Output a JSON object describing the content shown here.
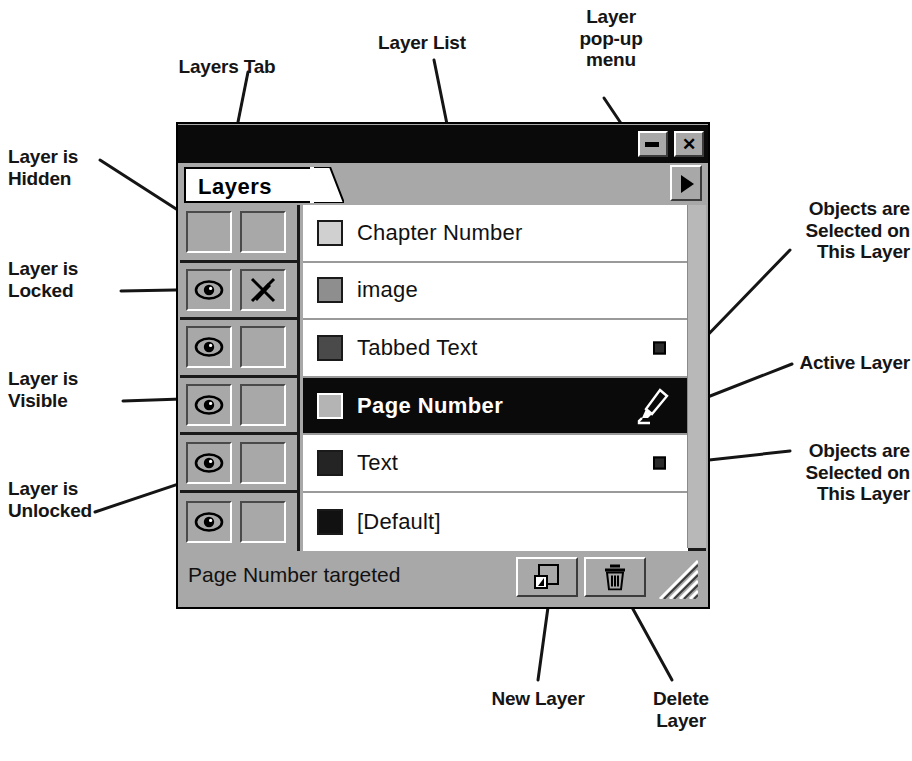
{
  "window": {
    "title": "",
    "minimize_label": "–",
    "close_label": "✕",
    "minimize_icon": "minimize-icon",
    "close_icon": "close-icon"
  },
  "tab": {
    "label": "Layers",
    "popup_icon": "triangle-right-icon"
  },
  "list": {
    "columns": [
      "visibility",
      "lock",
      "color",
      "name",
      "selection"
    ],
    "rows": [
      {
        "name": "Chapter Number",
        "swatch_color": "#d0d0d0",
        "visible": false,
        "locked": false,
        "active": false,
        "has_selected_objects": false
      },
      {
        "name": "image",
        "swatch_color": "#8e8e8e",
        "visible": true,
        "locked": true,
        "active": false,
        "has_selected_objects": false
      },
      {
        "name": "Tabbed Text",
        "swatch_color": "#4a4a4a",
        "visible": true,
        "locked": false,
        "active": false,
        "has_selected_objects": true
      },
      {
        "name": "Page Number",
        "swatch_color": "#b4b4b4",
        "visible": true,
        "locked": false,
        "active": true,
        "has_selected_objects": false
      },
      {
        "name": "Text",
        "swatch_color": "#242424",
        "visible": true,
        "locked": false,
        "active": false,
        "has_selected_objects": true
      },
      {
        "name": "[Default]",
        "swatch_color": "#111111",
        "visible": true,
        "locked": false,
        "active": false,
        "has_selected_objects": false
      }
    ]
  },
  "status": {
    "text": "Page Number targeted"
  },
  "toolbar": {
    "new_layer_label": "New Layer",
    "new_layer_icon": "new-page-icon",
    "delete_layer_label": "Delete Layer",
    "delete_layer_icon": "trash-icon",
    "resize_grip_icon": "resize-grip-icon"
  },
  "annotations": {
    "layers_tab": "Layers Tab",
    "layer_list": "Layer List",
    "layer_popup_menu": "Layer\npop-up\nmenu",
    "layer_hidden": "Layer is\nHidden",
    "layer_locked": "Layer is\nLocked",
    "layer_visible": "Layer is\nVisible",
    "layer_unlocked": "Layer is\nUnlocked",
    "objects_selected_top": "Objects are\nSelected on\nThis Layer",
    "active_layer": "Active Layer",
    "objects_selected_bottom": "Objects are\nSelected on\nThis Layer",
    "new_layer": "New Layer",
    "delete_layer": "Delete\nLayer"
  },
  "colors": {
    "panel_face": "#a8a8a8",
    "titlebar": "#0a0a0a",
    "list_background": "#ffffff",
    "active_row": "#0a0a0a",
    "active_row_text": "#ffffff",
    "annotation_text": "#151515"
  }
}
